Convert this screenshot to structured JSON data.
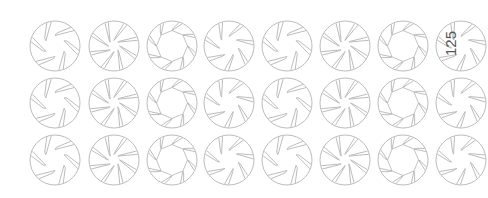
{
  "sheet": {
    "background": "#ffffff",
    "stroke_color": "#b4b4b4",
    "label_color": "#555555",
    "icon_radius": 25,
    "columns_x": [
      55,
      114,
      172,
      229,
      287,
      345,
      403,
      461
    ],
    "rows_y": [
      46,
      103,
      160
    ],
    "column_pattern": [
      "aperture-6",
      "aperture-8",
      "aperture-ring",
      "aperture-7",
      "aperture-6",
      "aperture-8",
      "aperture-ring",
      "aperture-7"
    ]
  },
  "label": {
    "text": "125",
    "x": 450,
    "y": 44,
    "rotation": -90
  },
  "icons": {
    "aperture-6": {
      "name": "aperture-6-blade-icon",
      "blades": 6,
      "inner": 0.42,
      "style": "wide"
    },
    "aperture-8": {
      "name": "aperture-8-blade-icon",
      "blades": 8,
      "inner": 0.22,
      "style": "pinwheel"
    },
    "aperture-ring": {
      "name": "aperture-ring-icon",
      "blades": 8,
      "inner": 0.62,
      "style": "ring"
    },
    "aperture-7": {
      "name": "aperture-7-blade-icon",
      "blades": 7,
      "inner": 0.38,
      "style": "pinwheel"
    }
  }
}
